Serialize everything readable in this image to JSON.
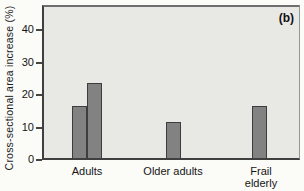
{
  "figure": {
    "panel_label": "(b)",
    "ylabel": "Cross-sectional area increase (%)"
  },
  "chart_data": {
    "type": "bar",
    "title": "",
    "xlabel": "",
    "ylabel": "Cross-sectional area increase (%)",
    "categories": [
      "Adults",
      "Older adults",
      "Frail elderly"
    ],
    "values_per_category": [
      [
        16,
        23
      ],
      [
        11
      ],
      [
        16
      ]
    ],
    "yticks": [
      0,
      10,
      20,
      30,
      40
    ],
    "ylim": [
      0,
      48
    ],
    "grid": false,
    "legend": "none",
    "unit": "%",
    "panel_label": "(b)",
    "plot_background": "#e8e8e5",
    "bar_color": "#828282",
    "bar_border_color": "#3d3d3d",
    "axis_color": "#454545",
    "text_color": "#151515"
  },
  "layout": {
    "baseline_y": 160,
    "px_per_unit": 3.25,
    "bar_width": 15,
    "bar_x": [
      [
        28,
        43
      ],
      [
        122
      ],
      [
        208
      ]
    ],
    "category_centers": [
      87,
      173,
      261
    ],
    "category_label_widths": [
      60,
      90,
      46
    ]
  }
}
